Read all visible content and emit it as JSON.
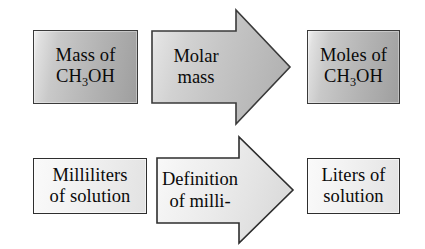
{
  "diagram": {
    "type": "flow-diagram",
    "background_color": "#ffffff",
    "text_color": "#0a0a0a",
    "rows": [
      {
        "id": "row-molar-mass",
        "source_label_line1": "Mass of",
        "source_label_line2_pre": "CH",
        "source_label_line2_sub": "3",
        "source_label_line2_post": "OH",
        "arrow_label_line1": "Molar",
        "arrow_label_line2": "mass",
        "target_label_line1": "Moles of",
        "target_label_line2_pre": "CH",
        "target_label_line2_sub": "3",
        "target_label_line2_post": "OH",
        "box_fill": "#b5b5b5",
        "arrow_fill": "#c6c6c6",
        "border_color": "#3a3a3a"
      },
      {
        "id": "row-milli",
        "source_label_line1": "Milliliters",
        "source_label_line2": "of solution",
        "arrow_label_line1": "Definition",
        "arrow_label_line2": "of milli-",
        "target_label_line1": "Liters of",
        "target_label_line2": "solution",
        "box_fill": "#eeeeee",
        "arrow_fill": "#ebebeb",
        "border_color": "#2e2e2e"
      }
    ]
  }
}
